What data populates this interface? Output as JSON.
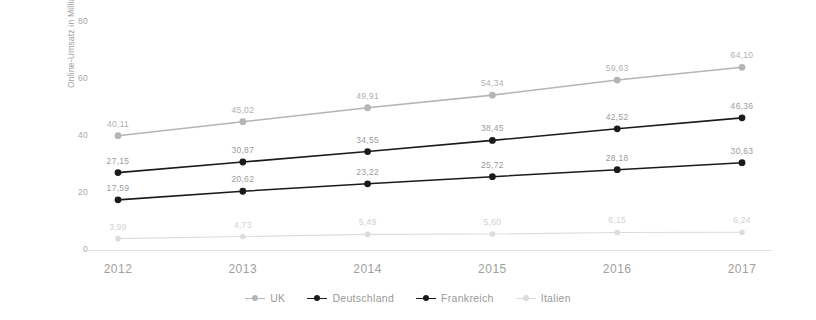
{
  "chart_data": {
    "type": "line",
    "title": "",
    "xlabel": "",
    "ylabel": "Online-Umsatz in Milliarden Euro",
    "categories": [
      "2012",
      "2013",
      "2014",
      "2015",
      "2016",
      "2017"
    ],
    "ylim": [
      0,
      80
    ],
    "yticks": [
      "0",
      "20",
      "40",
      "60",
      "80"
    ],
    "ytick_values": [
      0,
      20,
      40,
      60,
      80
    ],
    "grid": false,
    "legend_position": "bottom",
    "decimal_separator": ",",
    "series": [
      {
        "name": "UK",
        "color": "#b5b5b5",
        "values": [
          40.11,
          45.02,
          49.91,
          54.34,
          59.63,
          64.1
        ],
        "labels": [
          "40,11",
          "45,02",
          "49,91",
          "54,34",
          "59,63",
          "64,10"
        ]
      },
      {
        "name": "Deutschland",
        "color": "#1b1b1b",
        "values": [
          27.15,
          30.87,
          34.55,
          38.45,
          42.52,
          46.36
        ],
        "labels": [
          "27,15",
          "30,87",
          "34,55",
          "38,45",
          "42,52",
          "46,36"
        ]
      },
      {
        "name": "Frankreich",
        "color": "#1b1b1b",
        "values": [
          17.59,
          20.62,
          23.22,
          25.72,
          28.18,
          30.63
        ],
        "labels": [
          "17,59",
          "20,62",
          "23,22",
          "25,72",
          "28,18",
          "30,63"
        ]
      },
      {
        "name": "Italien",
        "color": "#dcdcdc",
        "values": [
          3.99,
          4.73,
          5.49,
          5.6,
          6.15,
          6.24
        ],
        "labels": [
          "3,99",
          "4,73",
          "5,49",
          "5,60",
          "6,15",
          "6,24"
        ]
      }
    ]
  },
  "axis": {
    "y_title": "Online-Umsatz in Milliarden Euro",
    "y_ticks": [
      "80",
      "60",
      "40",
      "20",
      "0"
    ],
    "x_ticks": [
      "2012",
      "2013",
      "2014",
      "2015",
      "2016",
      "2017"
    ]
  },
  "legend": {
    "items": [
      {
        "label": "UK"
      },
      {
        "label": "Deutschland"
      },
      {
        "label": "Frankreich"
      },
      {
        "label": "Italien"
      }
    ]
  }
}
